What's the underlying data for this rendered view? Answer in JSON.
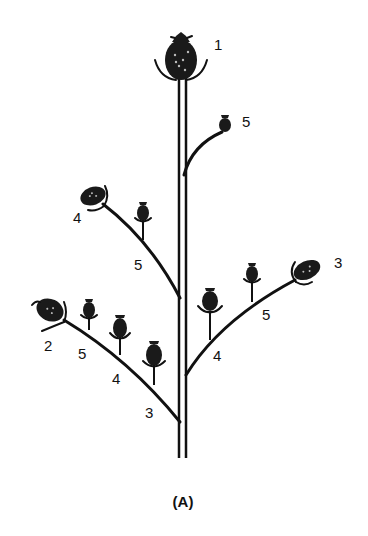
{
  "figure": {
    "caption": "(A)",
    "labels": {
      "main_head": "1",
      "upper_right_branch_head": "5",
      "upper_left_branch_tip": "4",
      "upper_left_branch_mid": "5",
      "lower_right_branch_tip": "3",
      "lower_right_branch_mid": "5",
      "lower_right_branch_base": "4",
      "lower_left_branch_tip": "2",
      "lower_left_branch_upper": "5",
      "lower_left_branch_mid": "4",
      "lower_left_branch_base": "3"
    }
  },
  "colors": {
    "ink": "#111111",
    "background": "#ffffff"
  }
}
